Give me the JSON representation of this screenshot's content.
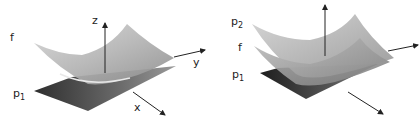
{
  "figure": {
    "left_panel": {
      "labels": {
        "f": "f",
        "p_base": "p",
        "p_sub": "1",
        "z": "z",
        "y": "y",
        "x": "x"
      },
      "surfaces": [
        "f (curved surface)",
        "p1 (flat plane)"
      ]
    },
    "right_panel": {
      "labels": {
        "p2_base": "p",
        "p2_sub": "2",
        "f": "f",
        "p1_base": "p",
        "p1_sub": "1"
      },
      "surfaces": [
        "p2 (upper curved surface)",
        "f (middle curved surface)",
        "p1 (flat plane)"
      ]
    },
    "colors": {
      "surface_light": "#c8c8c8",
      "surface_mid": "#9a9a9a",
      "plane_dark": "#3a3a3a",
      "axis": "#222222"
    }
  }
}
